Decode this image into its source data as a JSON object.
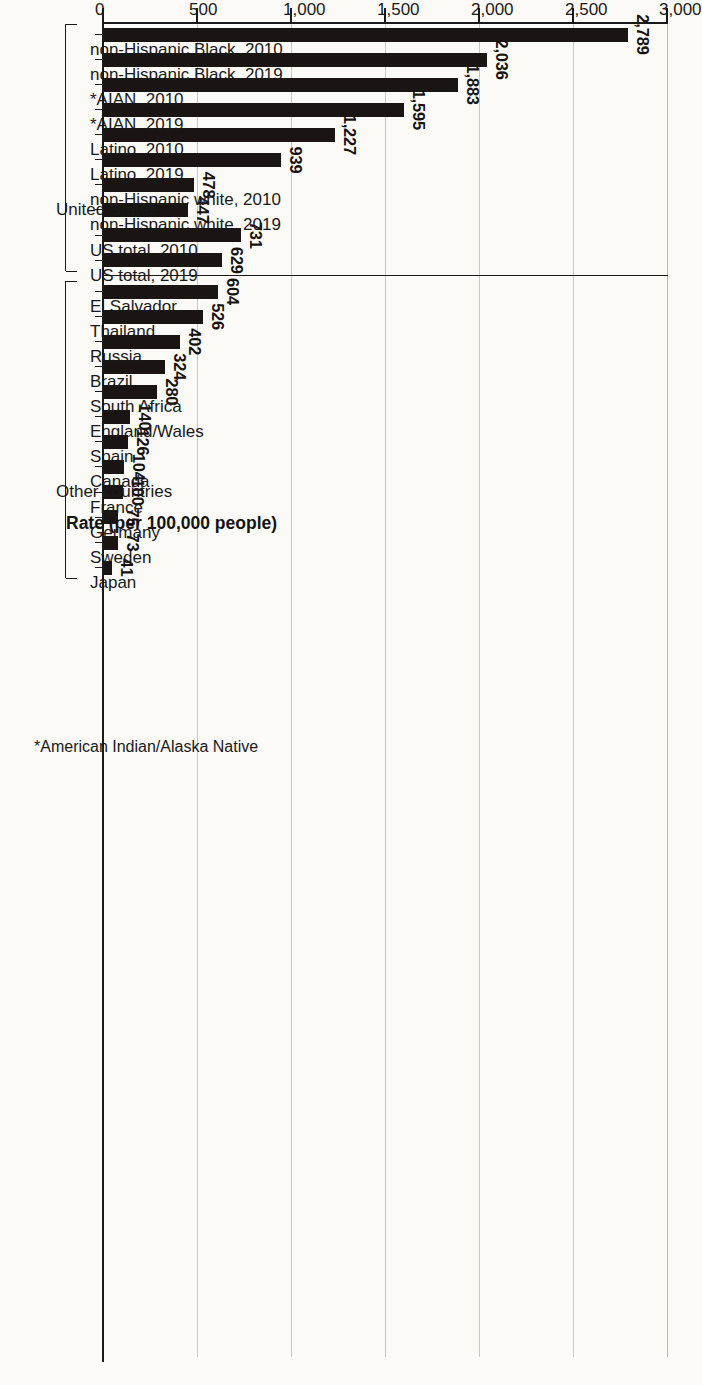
{
  "chart_data": {
    "type": "bar",
    "orientation": "horizontal",
    "title": "",
    "xlabel": "Rate (per 100,000 people)",
    "ylabel": "",
    "xlim": [
      0,
      3000
    ],
    "grid": true,
    "legend": null,
    "tick_labels": [
      "0",
      "500",
      "1,000",
      "1,500",
      "2,000",
      "2,500",
      "3,000"
    ],
    "tick_values": [
      0,
      500,
      1000,
      1500,
      2000,
      2500,
      3000
    ],
    "footnote": "*American Indian/Alaska Native",
    "groups": [
      {
        "name": "United States",
        "categories": [
          "non-Hispanic Black, 2010",
          "non-Hispanic Black, 2019",
          "*AIAN, 2010",
          "*AIAN, 2019",
          "Latino, 2010",
          "Latino, 2019",
          "non-Hispanic white, 2010",
          "non-Hispanic white, 2019",
          "US total, 2010",
          "US total, 2019"
        ],
        "values": [
          2789,
          2036,
          1883,
          1595,
          1227,
          939,
          478,
          447,
          731,
          629
        ],
        "value_labels": [
          "2,789",
          "2,036",
          "1,883",
          "1,595",
          "1,227",
          "939",
          "478",
          "447",
          "731",
          "629"
        ]
      },
      {
        "name": "Other countries",
        "categories": [
          "El Salvador",
          "Thailand",
          "Russia",
          "Brazil",
          "South Africa",
          "England/Wales",
          "Spain",
          "Canada",
          "France",
          "Germany",
          "Sweden",
          "Japan"
        ],
        "values": [
          604,
          526,
          402,
          324,
          280,
          140,
          126,
          104,
          100,
          75,
          73,
          41
        ],
        "value_labels": [
          "604",
          "526",
          "402",
          "324",
          "280",
          "140",
          "126",
          "104",
          "100",
          "75",
          "73",
          "41"
        ]
      }
    ],
    "categories": [
      "non-Hispanic Black, 2010",
      "non-Hispanic Black, 2019",
      "*AIAN, 2010",
      "*AIAN, 2019",
      "Latino, 2010",
      "Latino, 2019",
      "non-Hispanic white, 2010",
      "non-Hispanic white, 2019",
      "US total, 2010",
      "US total, 2019",
      "El Salvador",
      "Thailand",
      "Russia",
      "Brazil",
      "South Africa",
      "England/Wales",
      "Spain",
      "Canada",
      "France",
      "Germany",
      "Sweden",
      "Japan"
    ],
    "values": [
      2789,
      2036,
      1883,
      1595,
      1227,
      939,
      478,
      447,
      731,
      629,
      604,
      526,
      402,
      324,
      280,
      140,
      126,
      104,
      100,
      75,
      73,
      41
    ],
    "value_labels": [
      "2,789",
      "2,036",
      "1,883",
      "1,595",
      "1,227",
      "939",
      "478",
      "447",
      "731",
      "629",
      "604",
      "526",
      "402",
      "324",
      "280",
      "140",
      "126",
      "104",
      "100",
      "75",
      "73",
      "41"
    ],
    "bar_color": "#1a1512"
  }
}
